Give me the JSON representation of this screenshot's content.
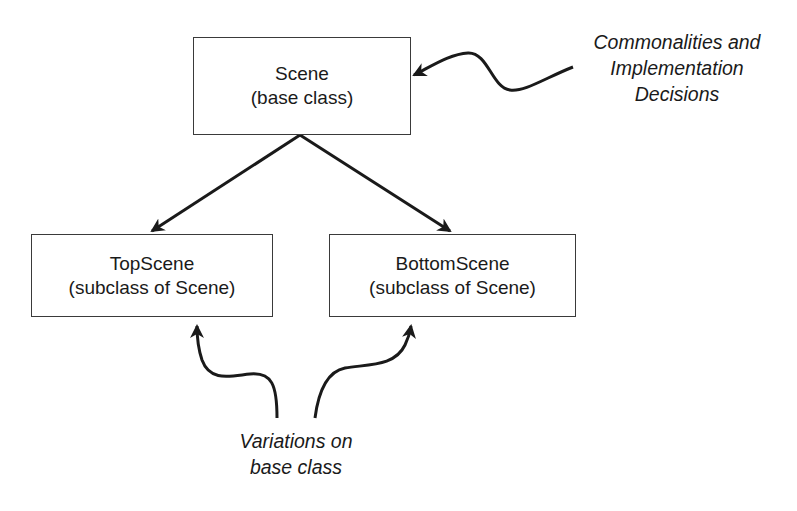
{
  "diagram": {
    "nodes": [
      {
        "id": "scene",
        "title": "Scene",
        "subtitle": "(base class)"
      },
      {
        "id": "topscene",
        "title": "TopScene",
        "subtitle": "(subclass of Scene)"
      },
      {
        "id": "bottomscene",
        "title": "BottomScene",
        "subtitle": "(subclass of Scene)"
      }
    ],
    "edges": [
      {
        "from": "scene",
        "to": "topscene",
        "type": "inheritance-arrow"
      },
      {
        "from": "scene",
        "to": "bottomscene",
        "type": "inheritance-arrow"
      }
    ],
    "annotations": {
      "commonalities": {
        "lines": [
          "Commonalities and",
          "Implementation",
          "Decisions"
        ],
        "points_to": "scene"
      },
      "variations": {
        "lines": [
          "Variations on",
          "base class"
        ],
        "points_to": [
          "topscene",
          "bottomscene"
        ]
      }
    },
    "colors": {
      "stroke": "#1a1a1a",
      "box_border": "#3a3a3a",
      "background": "#ffffff"
    }
  }
}
